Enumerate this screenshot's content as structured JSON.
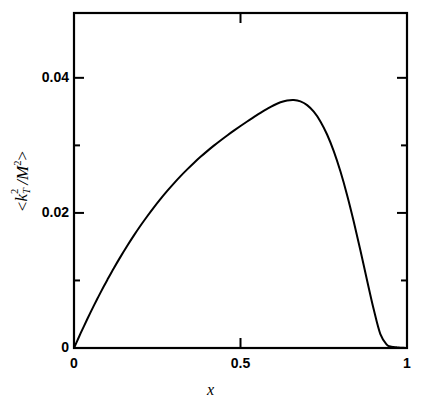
{
  "chart_data": {
    "type": "line",
    "title": "",
    "xlabel": "x",
    "ylabel": "<k_T^2/M^2>",
    "ylabel_parts": {
      "open": "<",
      "k": "k",
      "k_sup": "2",
      "k_sub": "T",
      "slash": "/",
      "M": "M",
      "M_sup": "2",
      "close": ">"
    },
    "xlim": [
      0,
      1
    ],
    "ylim": [
      0,
      0.0496
    ],
    "grid": false,
    "legend": null,
    "x_ticks_major": [
      "0",
      "0.5",
      "1"
    ],
    "x_tick_values_major": [
      0,
      0.5,
      1
    ],
    "y_ticks_major": [
      "0",
      "0.02",
      "0.04"
    ],
    "y_tick_values_major": [
      0,
      0.02,
      0.04
    ],
    "y_tick_values_minor": [
      0.01,
      0.03
    ],
    "x_tick_values_minor": [],
    "series": [
      {
        "name": "<k_T^2/M^2>",
        "color": "#000000",
        "linewidth": 2.0,
        "x": [
          0.0,
          0.01,
          0.02,
          0.03,
          0.04,
          0.05,
          0.06,
          0.07,
          0.08,
          0.09,
          0.1,
          0.12,
          0.14,
          0.16,
          0.18,
          0.2,
          0.22,
          0.24,
          0.26,
          0.28,
          0.3,
          0.32,
          0.34,
          0.36,
          0.38,
          0.4,
          0.42,
          0.44,
          0.46,
          0.48,
          0.5,
          0.52,
          0.54,
          0.56,
          0.58,
          0.6,
          0.62,
          0.64,
          0.66,
          0.68,
          0.7,
          0.72,
          0.74,
          0.76,
          0.78,
          0.8,
          0.82,
          0.84,
          0.86,
          0.88,
          0.9,
          0.92,
          0.94,
          0.95,
          0.96,
          0.97,
          0.975,
          0.98,
          0.985,
          0.99,
          0.995,
          1.0
        ],
        "y": [
          0.0,
          0.0011,
          0.00219,
          0.00325,
          0.00429,
          0.00531,
          0.00631,
          0.00728,
          0.00824,
          0.00917,
          0.01008,
          0.01185,
          0.01353,
          0.01514,
          0.01667,
          0.01813,
          0.01951,
          0.02083,
          0.02208,
          0.02326,
          0.02438,
          0.02545,
          0.02645,
          0.0274,
          0.0283,
          0.02915,
          0.02996,
          0.03073,
          0.03147,
          0.03218,
          0.03287,
          0.03354,
          0.03418,
          0.03481,
          0.0354,
          0.03594,
          0.03638,
          0.03666,
          0.03673,
          0.03652,
          0.03596,
          0.03499,
          0.03355,
          0.03161,
          0.02915,
          0.02616,
          0.02267,
          0.01874,
          0.01447,
          0.01003,
          0.00573,
          0.00205,
          0.00046,
          0.00024,
          0.00015,
          9e-05,
          7e-05,
          5e-05,
          3e-05,
          2e-05,
          1e-05,
          0.0
        ]
      }
    ],
    "peak": {
      "x": 0.56,
      "y": 0.0444
    },
    "annotations": []
  },
  "axes": {
    "frame": {
      "left": 74,
      "top": 13,
      "right": 407,
      "bottom": 348
    },
    "tick_inward_length_major": 10,
    "tick_inward_length_minor": 6,
    "frame_linewidth": 2
  },
  "x_tick_labels": [
    {
      "text": "0",
      "x": 0
    },
    {
      "text": "0.5",
      "x": 0.5
    },
    {
      "text": "1",
      "x": 1
    }
  ],
  "y_tick_labels": [
    {
      "text": "0",
      "y": 0
    },
    {
      "text": "0.02",
      "y": 0.02
    },
    {
      "text": "0.04",
      "y": 0.04
    }
  ]
}
